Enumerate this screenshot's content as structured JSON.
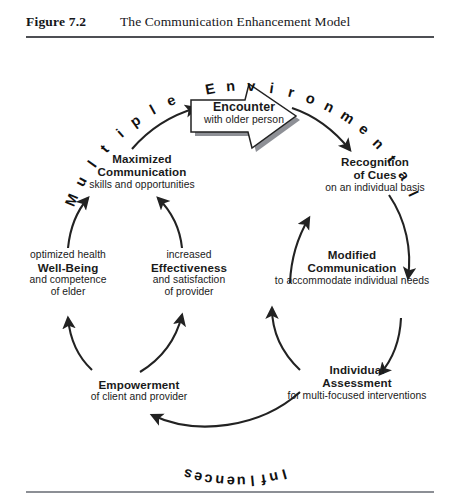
{
  "figure": {
    "label": "Figure 7.2",
    "title": "The Communication Enhancement Model"
  },
  "diagram": {
    "type": "cycle-diagram",
    "arc_labels": {
      "top": "Multiple Environmental",
      "bottom": "Influences"
    },
    "center_box": {
      "title": "Encounter",
      "subtitle": "with older person",
      "shape": "right-arrow-banner"
    },
    "nodes": [
      {
        "id": "recognition-of-cues",
        "title_lines": [
          "Recognition",
          "of Cues"
        ],
        "sub_lines": [
          "on an individual basis"
        ]
      },
      {
        "id": "modified-communication",
        "title_lines": [
          "Modified",
          "Communication"
        ],
        "sub_lines": [
          "to accommodate individual needs"
        ]
      },
      {
        "id": "individual-assessment",
        "title_lines": [
          "Individual",
          "Assessment"
        ],
        "sub_lines": [
          "for multi-focused interventions"
        ]
      },
      {
        "id": "empowerment",
        "title_lines": [
          "Empowerment"
        ],
        "sub_lines": [
          "of client and provider"
        ]
      },
      {
        "id": "effectiveness",
        "title_lines": [
          "Effectiveness"
        ],
        "sub_lines_above": [
          "increased"
        ],
        "sub_lines": [
          "and satisfaction",
          "of provider"
        ]
      },
      {
        "id": "well-being",
        "title_lines": [
          "Well-Being"
        ],
        "sub_lines_above": [
          "optimized health"
        ],
        "sub_lines": [
          "and competence",
          "of elder"
        ]
      },
      {
        "id": "maximized-communication",
        "title_lines": [
          "Maximized",
          "Communication"
        ],
        "sub_lines": [
          "skills and opportunities"
        ]
      }
    ],
    "text": {
      "recognition_t1": "Recognition",
      "recognition_t2": "of Cues",
      "recognition_s1": "on an individual basis",
      "modified_t1": "Modified",
      "modified_t2": "Communication",
      "modified_s1": "to accommodate individual needs",
      "assessment_t1": "Individual",
      "assessment_t2": "Assessment",
      "assessment_s1": "for multi-focused interventions",
      "empowerment_t1": "Empowerment",
      "empowerment_s1": "of client and provider",
      "effectiveness_s0": "increased",
      "effectiveness_t1": "Effectiveness",
      "effectiveness_s1": "and satisfaction",
      "effectiveness_s2": "of provider",
      "wellbeing_s0": "optimized health",
      "wellbeing_t1": "Well-Being",
      "wellbeing_s1": "and competence",
      "wellbeing_s2": "of elder",
      "maximized_t1": "Maximized",
      "maximized_t2": "Communication",
      "maximized_s1": "skills and opportunities",
      "encounter_t1": "Encounter",
      "encounter_s1": "with older person"
    }
  },
  "colors": {
    "ink": "#1a1a1a",
    "rule": "#4d4f54",
    "rule_light": "#8c8f95",
    "stroke": "#222222",
    "background": "#ffffff"
  }
}
